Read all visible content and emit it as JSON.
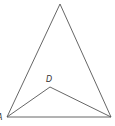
{
  "diagram": {
    "type": "geometry-figure",
    "points": {
      "apex": {
        "x": 60,
        "y": 4,
        "label": ""
      },
      "A": {
        "x": 7,
        "y": 117,
        "label": "A"
      },
      "B": {
        "x": 111,
        "y": 117,
        "label": ""
      },
      "D": {
        "x": 50,
        "y": 87,
        "label": "D"
      }
    },
    "segments": [
      [
        "A",
        "apex"
      ],
      [
        "apex",
        "B"
      ],
      [
        "A",
        "B"
      ],
      [
        "A",
        "D"
      ],
      [
        "D",
        "B"
      ]
    ],
    "labels": {
      "A": "A",
      "D": "D"
    },
    "colors": {
      "line": "#555555",
      "text": "#333333",
      "background": "#ffffff"
    }
  }
}
